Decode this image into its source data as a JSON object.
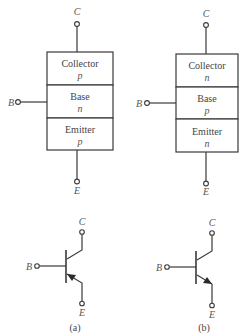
{
  "figure": {
    "panels": [
      {
        "id": "a",
        "caption": "(a)",
        "type": "PNP",
        "terminals": {
          "collector": "C",
          "base": "B",
          "emitter": "E"
        },
        "layers": [
          {
            "name": "Collector",
            "doping": "p"
          },
          {
            "name": "Base",
            "doping": "n"
          },
          {
            "name": "Emitter",
            "doping": "p"
          }
        ],
        "symbol": {
          "arrow_direction": "into-base"
        }
      },
      {
        "id": "b",
        "caption": "(b)",
        "type": "NPN",
        "terminals": {
          "collector": "C",
          "base": "B",
          "emitter": "E"
        },
        "layers": [
          {
            "name": "Collector",
            "doping": "n"
          },
          {
            "name": "Base",
            "doping": "p"
          },
          {
            "name": "Emitter",
            "doping": "n"
          }
        ],
        "symbol": {
          "arrow_direction": "out-of-base"
        }
      }
    ]
  }
}
